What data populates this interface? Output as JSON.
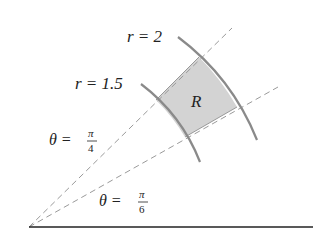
{
  "diagram": {
    "labels": {
      "outer_radius": "r = 2",
      "inner_radius": "r = 1.5",
      "region": "R",
      "upper_angle": {
        "lhs": "θ =",
        "num": "π",
        "den": "4"
      },
      "lower_angle": {
        "lhs": "θ =",
        "num": "π",
        "den": "6"
      }
    },
    "colors": {
      "region_fill": "#d3d3d3",
      "arc_stroke": "#8a8a8a",
      "ray_stroke": "#9a9a9a",
      "axis_stroke": "#222222"
    },
    "params": {
      "r_inner": 1.5,
      "r_outer": 2,
      "theta_low": "π/6",
      "theta_high": "π/4"
    }
  }
}
